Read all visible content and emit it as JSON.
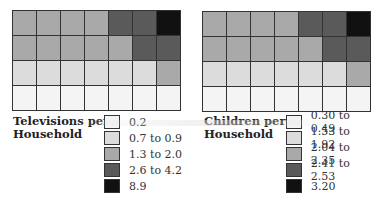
{
  "chart_data": [
    {
      "type": "heatmap",
      "title": "Televisions per Household",
      "rows": 4,
      "cols": 7,
      "cell_categories": [
        [
          2,
          2,
          2,
          2,
          3,
          3,
          4
        ],
        [
          2,
          2,
          2,
          2,
          2,
          3,
          3
        ],
        [
          1,
          1,
          1,
          1,
          1,
          1,
          2
        ],
        [
          0,
          0,
          0,
          0,
          0,
          0,
          0
        ]
      ],
      "legend": [
        {
          "label": "0.2",
          "color": "#f4f4f4"
        },
        {
          "label": "0.7 to 0.9",
          "color": "#dcdcdc"
        },
        {
          "label": "1.3 to 2.0",
          "color": "#a9a9a9"
        },
        {
          "label": "2.6 to 4.2",
          "color": "#5a5a5a"
        },
        {
          "label": "8.9",
          "color": "#111111"
        }
      ]
    },
    {
      "type": "heatmap",
      "title": "Children per Household",
      "rows": 4,
      "cols": 7,
      "cell_categories": [
        [
          2,
          2,
          2,
          2,
          3,
          3,
          4
        ],
        [
          2,
          2,
          2,
          2,
          2,
          3,
          3
        ],
        [
          1,
          1,
          1,
          1,
          1,
          1,
          2
        ],
        [
          0,
          0,
          0,
          0,
          0,
          0,
          0
        ]
      ],
      "legend": [
        {
          "label": "0.30 to 0.49",
          "color": "#f4f4f4"
        },
        {
          "label": "1.53 to 1.92",
          "color": "#dcdcdc"
        },
        {
          "label": "2.04 to 2.35",
          "color": "#a9a9a9"
        },
        {
          "label": "2.41 to 2.53",
          "color": "#5a5a5a"
        },
        {
          "label": "3.20",
          "color": "#111111"
        }
      ]
    }
  ],
  "left": {
    "title_line1": "Televisions per",
    "title_line2": "Household",
    "legend": [
      "0.2",
      "0.7 to 0.9",
      "1.3 to 2.0",
      "2.6 to 4.2",
      "8.9"
    ]
  },
  "right": {
    "title_line1": "Children per",
    "title_line2": "Household",
    "legend": [
      "0.30 to 0.49",
      "1.53 to 1.92",
      "2.04 to 2.35",
      "2.41 to 2.53",
      "3.20"
    ]
  }
}
